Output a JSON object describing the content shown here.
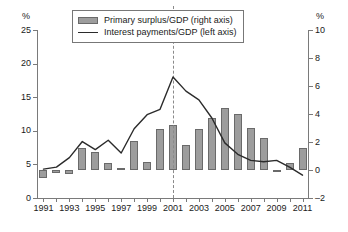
{
  "chart_data": {
    "type": "bar",
    "title": "",
    "subtitle": "",
    "xlabel": "",
    "ylabel": "%",
    "ylabel_right": "%",
    "grid": false,
    "legend_position": "top-center",
    "x": [
      1991,
      1992,
      1993,
      1994,
      1995,
      1996,
      1997,
      1998,
      1999,
      2000,
      2001,
      2002,
      2003,
      2004,
      2005,
      2006,
      2007,
      2008,
      2009,
      2010,
      2011
    ],
    "xtick_labels": [
      "1991",
      "1993",
      "1995",
      "1997",
      "1999",
      "2001",
      "2003",
      "2005",
      "2007",
      "2009",
      "2011"
    ],
    "xtick_values": [
      1991,
      1993,
      1995,
      1997,
      1999,
      2001,
      2003,
      2005,
      2007,
      2009,
      2011
    ],
    "ylim": [
      0,
      25
    ],
    "ytick_labels": [
      "0",
      "5",
      "10",
      "15",
      "20",
      "25"
    ],
    "ytick_values": [
      0,
      5,
      10,
      15,
      20,
      25
    ],
    "ylim_right": [
      -2,
      10
    ],
    "ytick_labels_right": [
      "-2",
      "0",
      "2",
      "4",
      "6",
      "8",
      "10"
    ],
    "ytick_values_right": [
      -2,
      0,
      2,
      4,
      6,
      8,
      10
    ],
    "annotations": [
      {
        "type": "vline",
        "x": 2001,
        "style": "dashed",
        "color": "#8a8a8a"
      }
    ],
    "series": [
      {
        "name": "Primary surplus/GDP (right axis)",
        "type": "bar",
        "axis": "right",
        "color": "#9d9d9d",
        "edge_color": "#6a6a6a",
        "values": [
          -0.6,
          -0.2,
          -0.3,
          1.6,
          1.3,
          0.5,
          0.0,
          2.1,
          0.6,
          2.9,
          3.2,
          1.8,
          2.9,
          3.7,
          4.4,
          4.0,
          3.0,
          2.3,
          -0.1,
          0.5,
          1.6
        ]
      },
      {
        "name": "Interest payments/GDP (left axis)",
        "type": "line",
        "axis": "left",
        "color": "#2b2b2b",
        "values": [
          4.3,
          4.6,
          6.0,
          8.4,
          7.2,
          8.6,
          6.7,
          10.3,
          12.4,
          13.2,
          18.0,
          15.9,
          14.6,
          11.9,
          8.2,
          6.5,
          5.6,
          5.4,
          5.6,
          4.6,
          3.4
        ]
      }
    ]
  },
  "legend": {
    "items": [
      {
        "label": "Primary surplus/GDP (right axis)",
        "marker": "swatch"
      },
      {
        "label": "Interest payments/GDP (left axis)",
        "marker": "line"
      }
    ]
  },
  "axes": {
    "left_unit": "%",
    "right_unit": "%"
  }
}
